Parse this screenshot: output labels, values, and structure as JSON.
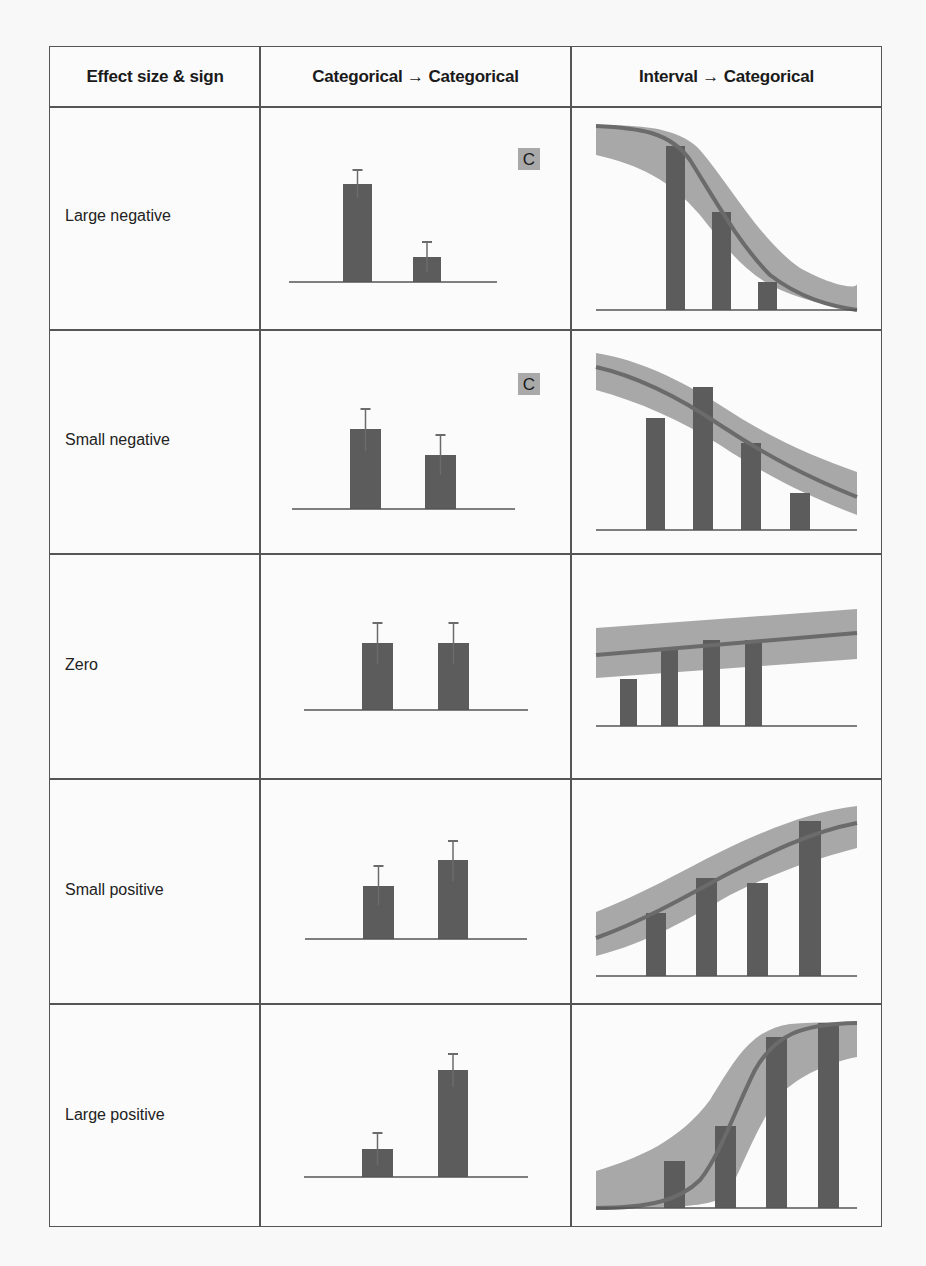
{
  "table": {
    "headers": [
      "Effect size & sign",
      "Categorical → Categorical",
      "Interval → Categorical"
    ],
    "rows": [
      {
        "label": "Large negative",
        "cat": {
          "baseline_y": 282,
          "x1": 289,
          "x2": 497,
          "bars": [
            {
              "x": 343,
              "w": 29,
              "top": 184,
              "err_top": 170,
              "err_bot": 198
            },
            {
              "x": 413,
              "w": 28,
              "top": 257,
              "err_top": 242,
              "err_bot": 272
            }
          ],
          "badge": {
            "text": "C",
            "x": 518,
            "y": 148
          }
        },
        "interval": {
          "baseline_y": 310,
          "band_top": "M596,126 C640,124 680,128 700,150 C730,185 760,240 800,268 C830,285 857,290 857,284",
          "band_bottom": "M857,310 C830,306 800,300 770,285 C740,268 720,240 700,215 C670,180 640,165 596,155 Z",
          "line": "M596,126 C640,128 670,132 690,160 C715,200 740,245 770,275 C800,298 830,306 857,310",
          "bars": [
            {
              "x": 666,
              "w": 19,
              "top": 146
            },
            {
              "x": 712,
              "w": 19,
              "top": 212
            },
            {
              "x": 758,
              "w": 19,
              "top": 282
            }
          ]
        }
      },
      {
        "label": "Small negative",
        "cat": {
          "baseline_y": 509,
          "x1": 292,
          "x2": 515,
          "bars": [
            {
              "x": 350,
              "w": 31,
              "top": 429,
              "err_top": 409,
              "err_bot": 451
            },
            {
              "x": 425,
              "w": 31,
              "top": 455,
              "err_top": 435,
              "err_bot": 475
            }
          ],
          "badge": {
            "text": "C",
            "x": 518,
            "y": 373
          }
        },
        "interval": {
          "baseline_y": 530,
          "band_top": "M596,353 C640,360 680,380 720,405 C770,438 810,455 857,472",
          "band_bottom": "L857,515 C810,497 770,478 720,445 C680,420 640,402 596,390 Z",
          "line": "M596,367 C640,377 680,398 720,425 C770,458 810,478 857,497",
          "bars": [
            {
              "x": 646,
              "w": 19,
              "top": 418
            },
            {
              "x": 693,
              "w": 20,
              "top": 387
            },
            {
              "x": 741,
              "w": 20,
              "top": 443
            },
            {
              "x": 790,
              "w": 20,
              "top": 493
            }
          ]
        }
      },
      {
        "label": "Zero",
        "cat": {
          "baseline_y": 710,
          "x1": 304,
          "x2": 528,
          "bars": [
            {
              "x": 362,
              "w": 31,
              "top": 643,
              "err_top": 623,
              "err_bot": 664
            },
            {
              "x": 438,
              "w": 31,
              "top": 643,
              "err_top": 623,
              "err_bot": 664
            }
          ],
          "badge": null
        },
        "interval": {
          "baseline_y": 726,
          "band_top": "M596,628 L857,609",
          "band_bottom": "L857,659 L596,678 Z",
          "line": "M596,655 L857,633",
          "bars": [
            {
              "x": 620,
              "w": 17,
              "top": 679
            },
            {
              "x": 661,
              "w": 17,
              "top": 648
            },
            {
              "x": 703,
              "w": 17,
              "top": 640
            },
            {
              "x": 745,
              "w": 17,
              "top": 640
            }
          ]
        }
      },
      {
        "label": "Small positive",
        "cat": {
          "baseline_y": 939,
          "x1": 305,
          "x2": 527,
          "bars": [
            {
              "x": 363,
              "w": 31,
              "top": 886,
              "err_top": 866,
              "err_bot": 905
            },
            {
              "x": 438,
              "w": 30,
              "top": 860,
              "err_top": 841,
              "err_bot": 881
            }
          ],
          "badge": null
        },
        "interval": {
          "baseline_y": 976,
          "band_top": "M596,912 C640,895 680,872 720,852 C770,828 810,812 857,806",
          "band_bottom": "L857,848 C810,860 770,875 730,895 C690,918 650,942 596,956 Z",
          "line": "M596,938 C640,922 680,900 720,878 C770,852 810,832 857,823",
          "bars": [
            {
              "x": 646,
              "w": 20,
              "top": 913
            },
            {
              "x": 696,
              "w": 21,
              "top": 878
            },
            {
              "x": 747,
              "w": 21,
              "top": 883
            },
            {
              "x": 799,
              "w": 22,
              "top": 821
            }
          ]
        }
      },
      {
        "label": "Large positive",
        "cat": {
          "baseline_y": 1177,
          "x1": 304,
          "x2": 528,
          "bars": [
            {
              "x": 362,
              "w": 31,
              "top": 1149,
              "err_top": 1133,
              "err_bot": 1165
            },
            {
              "x": 438,
              "w": 30,
              "top": 1070,
              "err_top": 1054,
              "err_bot": 1087
            }
          ],
          "badge": null
        },
        "interval": {
          "baseline_y": 1208,
          "band_top": "M596,1171 C640,1158 680,1140 710,1100 C735,1060 750,1030 790,1024 C820,1022 840,1022 857,1022",
          "band_bottom": "L857,1057 C830,1062 800,1075 780,1095 C760,1120 745,1160 730,1190 C720,1205 700,1208 596,1208 Z",
          "line": "M596,1208 C650,1208 680,1200 700,1180 C720,1155 735,1110 755,1070 C775,1035 800,1024 857,1023",
          "bars": [
            {
              "x": 664,
              "w": 21,
              "top": 1161
            },
            {
              "x": 715,
              "w": 21,
              "top": 1126
            },
            {
              "x": 766,
              "w": 21,
              "top": 1037
            },
            {
              "x": 818,
              "w": 21,
              "top": 1023
            }
          ]
        }
      }
    ]
  },
  "colors": {
    "bar": "#5c5c5c",
    "band": "#a8a8a8",
    "fit_line": "#6b6b6b",
    "axis": "#555555",
    "badge_bg": "#a9a9a9",
    "badge_text": "#1a1a1a",
    "border": "#555555"
  }
}
